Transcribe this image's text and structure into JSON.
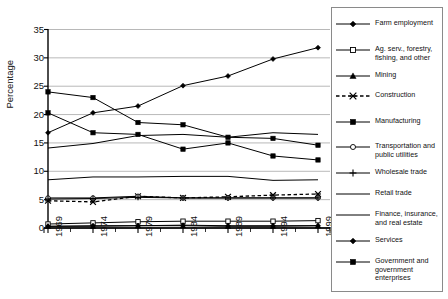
{
  "chart_data": {
    "type": "line",
    "title": "",
    "xlabel": "",
    "ylabel": "Percentage",
    "categories": [
      "1969",
      "1974",
      "1979",
      "1984",
      "1989",
      "1994",
      "1999"
    ],
    "ylim": [
      0,
      35
    ],
    "ytick_step": 5,
    "yticks": [
      "0",
      "5",
      "10",
      "15",
      "20",
      "25",
      "30",
      "35"
    ],
    "grid": "horizontal",
    "legend_position": "right",
    "series": [
      {
        "name": "Farm employment",
        "marker": "filled-diamond",
        "linestyle": "solid",
        "color": "#000000",
        "values": [
          16.8,
          20.3,
          21.5,
          25.1,
          26.8,
          29.8,
          31.8
        ]
      },
      {
        "name": "Ag. serv., forestry, fishing, and other",
        "marker": "open-square",
        "linestyle": "solid",
        "color": "#000000",
        "values": [
          0.7,
          0.9,
          1.1,
          1.2,
          1.2,
          1.2,
          1.3
        ]
      },
      {
        "name": "Mining",
        "marker": "filled-triangle",
        "linestyle": "solid",
        "color": "#000000",
        "values": [
          0.3,
          0.3,
          0.4,
          0.4,
          0.3,
          0.3,
          0.4
        ]
      },
      {
        "name": "Construction",
        "marker": "cross-x",
        "linestyle": "dashed",
        "color": "#000000",
        "values": [
          4.8,
          4.6,
          5.6,
          5.3,
          5.5,
          5.8,
          6.0
        ]
      },
      {
        "name": "Manufacturing",
        "marker": "filled-square",
        "linestyle": "solid",
        "color": "#000000",
        "values": [
          24.0,
          23.0,
          18.6,
          18.2,
          16.0,
          15.8,
          14.6
        ]
      },
      {
        "name": "Transportation and public utilities",
        "marker": "open-circle",
        "linestyle": "solid",
        "color": "#000000",
        "values": [
          5.3,
          5.3,
          5.6,
          5.3,
          5.3,
          5.3,
          5.3
        ]
      },
      {
        "name": "Wholesale trade",
        "marker": "plus",
        "linestyle": "solid",
        "color": "#000000",
        "values": [
          5.1,
          5.2,
          5.4,
          5.3,
          5.3,
          5.3,
          5.3
        ]
      },
      {
        "name": "Retail trade",
        "marker": "none",
        "linestyle": "solid",
        "color": "#000000",
        "values": [
          8.5,
          9.0,
          9.0,
          9.1,
          9.1,
          8.4,
          8.5
        ]
      },
      {
        "name": "Finance, insurance, and real estate",
        "marker": "none",
        "linestyle": "solid",
        "color": "#000000",
        "values": [
          14.1,
          14.9,
          16.3,
          16.5,
          16.0,
          16.8,
          16.5
        ]
      },
      {
        "name": "Services",
        "marker": "filled-diamond",
        "linestyle": "solid",
        "color": "#000000",
        "values": [
          0.3,
          0.4,
          0.4,
          0.5,
          0.4,
          0.4,
          0.4
        ]
      },
      {
        "name": "Government and government enterprises",
        "marker": "filled-square",
        "linestyle": "solid",
        "color": "#000000",
        "values": [
          20.3,
          16.8,
          16.5,
          13.9,
          15.0,
          12.7,
          12.0
        ]
      }
    ]
  },
  "legend": {
    "items": [
      {
        "label": "Farm employment"
      },
      {
        "label": "Ag. serv., forestry, fishing, and other"
      },
      {
        "label": "Mining"
      },
      {
        "label": "Construction"
      },
      {
        "label": "Manufacturing"
      },
      {
        "label": "Transportation and public utilities"
      },
      {
        "label": "Wholesale trade"
      },
      {
        "label": "Retail trade"
      },
      {
        "label": "Finance, insurance, and real estate"
      },
      {
        "label": "Services"
      },
      {
        "label": "Government and government enterprises"
      }
    ]
  }
}
